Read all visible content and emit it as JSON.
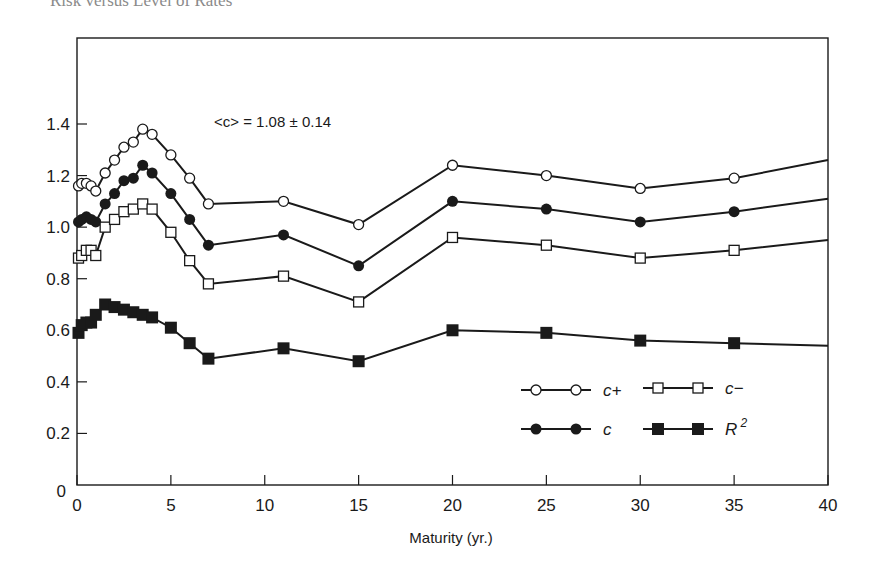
{
  "page": {
    "running_header": "Risk versus Level of Rates"
  },
  "chart_data": {
    "type": "line",
    "title": "",
    "annotation": "<c> = 1.08 ± 0.14",
    "xlabel": "Maturity (yr.)",
    "ylabel": "",
    "xlim": [
      0,
      40
    ],
    "ylim": [
      0,
      1.5
    ],
    "x_ticks": [
      0,
      5,
      10,
      15,
      20,
      25,
      30,
      35,
      40
    ],
    "y_ticks": [
      0,
      0.2,
      0.4,
      0.6,
      0.8,
      1.0,
      1.2,
      1.4
    ],
    "x_tick_labels": [
      "0",
      "5",
      "10",
      "15",
      "20",
      "25",
      "30",
      "35",
      "40"
    ],
    "y_tick_labels": [
      "0",
      "0.2",
      "0.4",
      "0.6",
      "0.8",
      "1.0",
      "1.2",
      "1.4"
    ],
    "grid": false,
    "legend_position": "lower right (inside)",
    "series": [
      {
        "name": "c+",
        "marker": "open-circle",
        "x": [
          0.08,
          0.25,
          0.5,
          0.75,
          1.0,
          1.5,
          2.0,
          2.5,
          3.0,
          3.5,
          4.0,
          5.0,
          6.0,
          7.0,
          11.0,
          15.0,
          20.0,
          25.0,
          30.0,
          35.0,
          40.0
        ],
        "values": [
          1.16,
          1.17,
          1.17,
          1.16,
          1.14,
          1.21,
          1.26,
          1.31,
          1.33,
          1.38,
          1.36,
          1.28,
          1.19,
          1.09,
          1.1,
          1.01,
          1.24,
          1.2,
          1.15,
          1.19,
          1.26
        ]
      },
      {
        "name": "c",
        "marker": "filled-circle",
        "x": [
          0.08,
          0.25,
          0.5,
          0.75,
          1.0,
          1.5,
          2.0,
          2.5,
          3.0,
          3.5,
          4.0,
          5.0,
          6.0,
          7.0,
          11.0,
          15.0,
          20.0,
          25.0,
          30.0,
          35.0,
          40.0
        ],
        "values": [
          1.02,
          1.03,
          1.04,
          1.03,
          1.02,
          1.09,
          1.13,
          1.18,
          1.19,
          1.24,
          1.21,
          1.13,
          1.03,
          0.93,
          0.97,
          0.85,
          1.1,
          1.07,
          1.02,
          1.06,
          1.11
        ]
      },
      {
        "name": "c−",
        "marker": "open-square",
        "x": [
          0.08,
          0.25,
          0.5,
          0.75,
          1.0,
          1.5,
          2.0,
          2.5,
          3.0,
          3.5,
          4.0,
          5.0,
          6.0,
          7.0,
          11.0,
          15.0,
          20.0,
          25.0,
          30.0,
          35.0,
          40.0
        ],
        "values": [
          0.88,
          0.89,
          0.91,
          0.91,
          0.89,
          1.0,
          1.03,
          1.06,
          1.07,
          1.09,
          1.07,
          0.98,
          0.87,
          0.78,
          0.81,
          0.71,
          0.96,
          0.93,
          0.88,
          0.91,
          0.95
        ]
      },
      {
        "name": "R²",
        "marker": "filled-square",
        "x": [
          0.08,
          0.25,
          0.5,
          0.75,
          1.0,
          1.5,
          2.0,
          2.5,
          3.0,
          3.5,
          4.0,
          5.0,
          6.0,
          7.0,
          11.0,
          15.0,
          20.0,
          25.0,
          30.0,
          35.0,
          40.0
        ],
        "values": [
          0.59,
          0.62,
          0.63,
          0.63,
          0.66,
          0.7,
          0.69,
          0.68,
          0.67,
          0.66,
          0.65,
          0.61,
          0.55,
          0.49,
          0.53,
          0.48,
          0.6,
          0.59,
          0.56,
          0.55,
          0.54
        ]
      }
    ]
  },
  "legend": {
    "items": [
      {
        "label": "c+",
        "marker": "open-circle"
      },
      {
        "label": "c−",
        "marker": "open-square"
      },
      {
        "label": "c",
        "marker": "filled-circle"
      },
      {
        "label": "R",
        "sup": "2",
        "marker": "filled-square"
      }
    ]
  },
  "colors": {
    "ink": "#1a1a1a",
    "background": "#ffffff",
    "header_ink": "#8a8a8a"
  }
}
